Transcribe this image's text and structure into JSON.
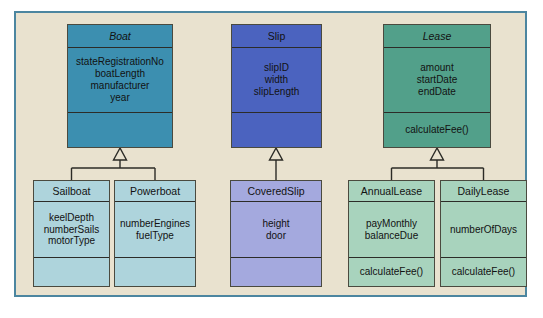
{
  "diagram": {
    "kind": "uml-class-diagram",
    "title": "",
    "background_color": "#e9e2cf",
    "frame_border_color": "#4c86a0",
    "page_color": "#ffffff",
    "relationship_type": "generalization"
  },
  "palette": {
    "boat": "#3c8fb0",
    "slip": "#4b63bf",
    "lease": "#52a08a",
    "boat_sub": "#aed4dc",
    "slip_sub": "#a4a9de",
    "lease_sub": "#a8d3bd",
    "line": "#2b2b26",
    "text": "#121212"
  },
  "classes": {
    "boat": {
      "name": "Boat",
      "abstract": true,
      "attributes": [
        "stateRegistrationNo",
        "boatLength",
        "manufacturer",
        "year"
      ],
      "operations": []
    },
    "slip": {
      "name": "Slip",
      "abstract": false,
      "attributes": [
        "slipID",
        "width",
        "slipLength"
      ],
      "operations": []
    },
    "lease": {
      "name": "Lease",
      "abstract": true,
      "attributes": [
        "amount",
        "startDate",
        "endDate"
      ],
      "operations": [
        "calculateFee()"
      ]
    },
    "sailboat": {
      "name": "Sailboat",
      "abstract": false,
      "attributes": [
        "keelDepth",
        "numberSails",
        "motorType"
      ],
      "operations": []
    },
    "powerboat": {
      "name": "Powerboat",
      "abstract": false,
      "attributes": [
        "numberEngines",
        "fuelType"
      ],
      "operations": []
    },
    "coveredslip": {
      "name": "CoveredSlip",
      "abstract": false,
      "attributes": [
        "height",
        "door"
      ],
      "operations": []
    },
    "annuallease": {
      "name": "AnnualLease",
      "abstract": false,
      "attributes": [
        "payMonthly",
        "balanceDue"
      ],
      "operations": [
        "calculateFee()"
      ]
    },
    "dailylease": {
      "name": "DailyLease",
      "abstract": false,
      "attributes": [
        "numberOfDays"
      ],
      "operations": [
        "calculateFee()"
      ]
    }
  },
  "generalizations": [
    {
      "parent": "Boat",
      "children": [
        "Sailboat",
        "Powerboat"
      ]
    },
    {
      "parent": "Slip",
      "children": [
        "CoveredSlip"
      ]
    },
    {
      "parent": "Lease",
      "children": [
        "AnnualLease",
        "DailyLease"
      ]
    }
  ]
}
